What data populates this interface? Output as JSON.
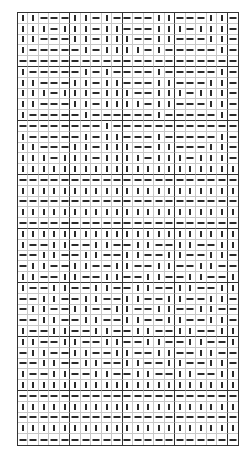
{
  "puzzle": {
    "cols": 21,
    "rows": 40,
    "block_cols": [
      5,
      5,
      5,
      5,
      1
    ],
    "block_rows": 5,
    "legend": {
      "V": "vertical-bar",
      "H": "horizontal-dash"
    },
    "grid": [
      "VVHHHVVHVHHHHVVHHHVVH",
      "VVVHVVVHVVHHHVVVHVVVH",
      "VVHHHVVHVVVHHVVHHHVVH",
      "VHHHHHVHVVVVHVHHHHHVH",
      "HHHHHHHHHHHHHHHHHHHHH",
      "VHHHHHVHVHHHHVHHHHHVH",
      "VVHHHVVHVVHHHVVHHHVVH",
      "VVVHVVVHVVVHHVVVHVVVH",
      "VVHHHVVHVVVVHVVHHHVVH",
      "VHHHHHVHHHHHHVHHHHHVH",
      "HHHHHHHHVHHHHHHHHHHHH",
      "VHHHHHVHVVHHHVHHHHHVH",
      "VVHHHVVHVVVHHVVHHHVVH",
      "VVVHVVVHVVVVHVVVHVVVH",
      "VVVVVVVVVVVVVVVVVVVVV",
      "HHHHHHHHHHHHHHHHHHHHH",
      "VVVVVVVVVVVVVVVVVVVVV",
      "HHHHHHHHHHHHHHHHHHHHH",
      "VVVVVVVVVVVVVVVVVVVVV",
      "HHHHHHHHHHHHHHHHHHHHH",
      "VVVVVVVVVVVVVVVVVVVVV",
      "VHHVVHHVVHHVVHHVVHHVV",
      "HHVVHHVVHHVVHHVVHHVVH",
      "HVVHHVVHHVVHHVVHHVVHH",
      "VVHHVVHHVVHHVVHHVVHHV",
      "VHHVVHHVVHHVVHHVVHHVV",
      "HHVVHHVVHHVVHHVVHHVVH",
      "HVVHHVVHHVVHHVVHHVVHH",
      "HHVVHHVVHHVVHHVVHHVVH",
      "VHHVVHHVVHHVVHHVVHHVV",
      "VVHHVVHHVVHHVVHHVVHHV",
      "HVVHHVVHHVVHHVVHHVVHH",
      "HHVVHHVVHHVVHHVVHHVVH",
      "VHHVVHHVVHHVVHHVVHHVV",
      "VVVVVVVVVVVVVVVVVVVVV",
      "HHHHHHHHHHHHHHHHHHHHH",
      "VVVVVVVVVVVVVVVVVVVVV",
      "HHHHHHHHHHHHHHHHHHHHH",
      "VVVVVVVVVVVVVVVVVVVVV",
      "HHHHHHHHHHHHHHHHHHHHH"
    ]
  },
  "colors": {
    "background": "#ffffff",
    "mark": "#2a2a2a",
    "thin_line": "#c8c8c8",
    "thick_line": "#333333"
  }
}
